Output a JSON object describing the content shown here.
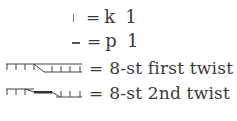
{
  "legend": {
    "rows": [
      {
        "symbol": "knit-stitch-symbol",
        "equals": "=",
        "label": "k 1"
      },
      {
        "symbol": "purl-stitch-symbol",
        "equals": "=",
        "label": "p 1"
      },
      {
        "symbol": "first-twist-cable-symbol",
        "equals": "=",
        "label": "8-st first twist"
      },
      {
        "symbol": "second-twist-cable-symbol",
        "equals": "=",
        "label": "8-st 2nd twist"
      }
    ]
  },
  "colors": {
    "text": "#3a3a3a",
    "symbol": "#444444",
    "background": "#ffffff"
  }
}
